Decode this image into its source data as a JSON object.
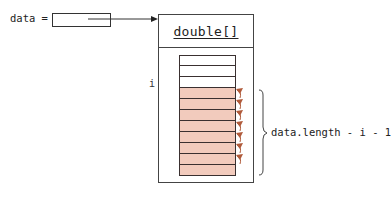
{
  "variable": {
    "name_label": "data =",
    "arrow_target": "array-object"
  },
  "array_object": {
    "type_label": "double[]",
    "index_label": "i",
    "cells": [
      {
        "state": "white"
      },
      {
        "state": "white"
      },
      {
        "state": "white"
      },
      {
        "state": "pink"
      },
      {
        "state": "pink"
      },
      {
        "state": "pink"
      },
      {
        "state": "pink"
      },
      {
        "state": "pink"
      },
      {
        "state": "pink"
      },
      {
        "state": "pink"
      },
      {
        "state": "pink"
      }
    ],
    "swap_arrow_count": 7
  },
  "brace": {
    "label": "data.length - i - 1"
  },
  "colors": {
    "highlight_fill": "#f2cbbd",
    "swap_arrow": "#b05a3a",
    "outline": "#333333"
  }
}
